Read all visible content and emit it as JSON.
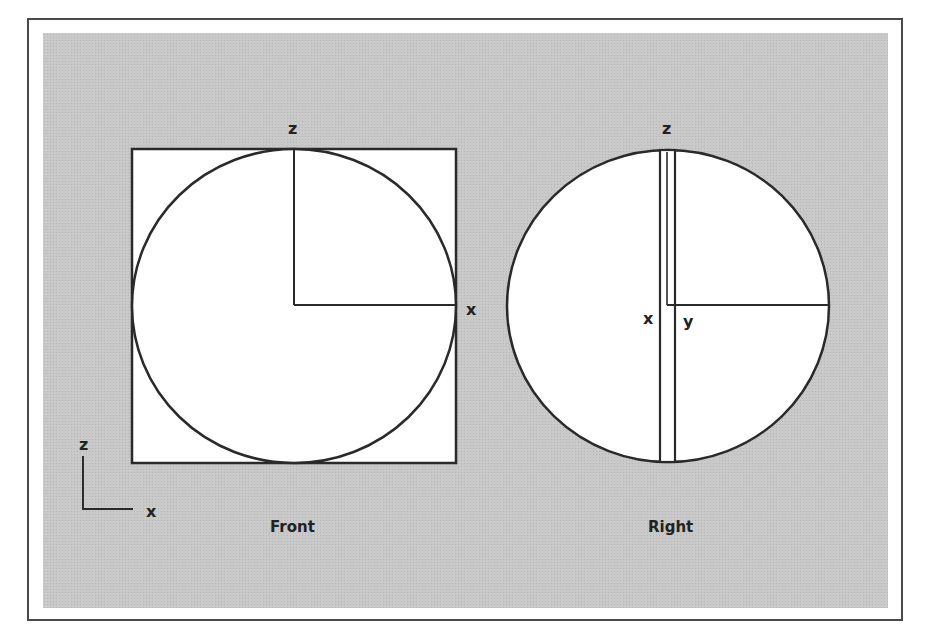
{
  "figure": {
    "views": [
      {
        "id": "front",
        "caption": "Front",
        "axis_labels": {
          "vertical": "z",
          "horizontal": "x"
        }
      },
      {
        "id": "right",
        "caption": "Right",
        "axis_labels": {
          "vertical": "z",
          "left": "x",
          "right": "y"
        }
      }
    ],
    "axis_indicator": {
      "vertical": "z",
      "horizontal": "x"
    }
  },
  "colors": {
    "background_panel": "#c9c9c9",
    "shape_fill": "#ffffff",
    "stroke": "#2a2a2a"
  }
}
